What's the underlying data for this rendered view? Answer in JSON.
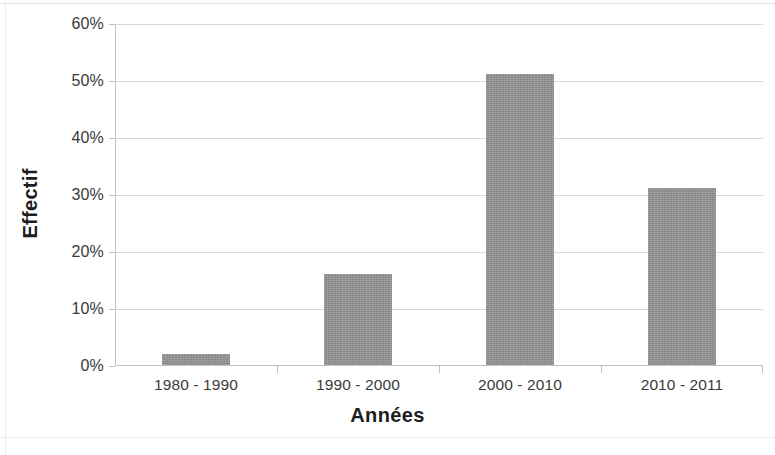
{
  "chart_data": {
    "type": "bar",
    "title": "",
    "subtitle": "",
    "categories": [
      "1980 - 1990",
      "1990 - 2000",
      "2000 - 2010",
      "2010 - 2011"
    ],
    "values": [
      2,
      16,
      51,
      31
    ],
    "value_suffix": "%",
    "xlabel": "Années",
    "ylabel": "Effectif",
    "ylim": [
      0,
      60
    ],
    "ytick_labels": [
      "0%",
      "10%",
      "20%",
      "30%",
      "40%",
      "50%",
      "60%"
    ],
    "ytick_values": [
      0,
      10,
      20,
      30,
      40,
      50,
      60
    ],
    "grid": true,
    "grid_axis": "y",
    "legend": false,
    "legend_position": "none",
    "series": [
      {
        "name": "Effectif",
        "color": "#989898",
        "values": [
          2,
          16,
          51,
          31
        ]
      }
    ],
    "colors": {
      "bar_fill": "#989898",
      "gridline": "#d9d9d9",
      "axis_line": "#bfbfbf",
      "tick_text": "#3a3a3a",
      "axis_title_text": "#1d1d1d",
      "background": "#ffffff"
    }
  }
}
